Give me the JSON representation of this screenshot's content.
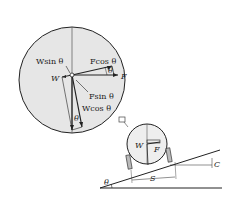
{
  "diagram": {
    "magnified_view": {
      "labels": {
        "w_sin": "Wsin θ",
        "f_cos": "Fcos θ",
        "w": "W",
        "f": "F",
        "f_sin": "Fsin θ",
        "w_cos": "Wcos θ",
        "theta_upper": "θ",
        "theta_lower": "θ"
      }
    },
    "vehicle_view": {
      "labels": {
        "w": "W",
        "f": "F",
        "c": "C",
        "s": "S",
        "theta": "θ"
      }
    },
    "colors": {
      "circle_fill": "#e6e6e6",
      "stroke": "#222222",
      "background": "#ffffff"
    }
  }
}
